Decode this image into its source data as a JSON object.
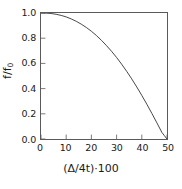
{
  "chart_data": {
    "type": "line",
    "title": "",
    "xlabel": "(Δ/4t)·100",
    "ylabel_main": "f/f",
    "ylabel_sub": "0",
    "xlim": [
      0,
      50
    ],
    "ylim": [
      0.0,
      1.0
    ],
    "xticks": [
      0,
      10,
      20,
      30,
      40,
      50
    ],
    "xtick_labels": [
      "0",
      "10",
      "20",
      "30",
      "40",
      "50"
    ],
    "yticks": [
      0.0,
      0.2,
      0.4,
      0.6,
      0.8,
      1.0
    ],
    "ytick_labels": [
      "0.0",
      "0.2",
      "0.4",
      "0.6",
      "0.8",
      "1.0"
    ],
    "grid": false,
    "legend": null,
    "series": [
      {
        "name": "f/f0",
        "color": "#333333",
        "x": [
          0,
          2,
          4,
          6,
          8,
          10,
          12,
          14,
          16,
          18,
          20,
          22,
          24,
          26,
          28,
          30,
          32,
          34,
          36,
          38,
          40,
          42,
          44,
          46,
          48,
          49,
          50
        ],
        "y": [
          1.0,
          0.999,
          0.996,
          0.99,
          0.981,
          0.969,
          0.953,
          0.934,
          0.911,
          0.885,
          0.855,
          0.821,
          0.783,
          0.741,
          0.696,
          0.647,
          0.594,
          0.537,
          0.477,
          0.413,
          0.346,
          0.276,
          0.203,
          0.128,
          0.051,
          0.026,
          0.0
        ]
      }
    ]
  },
  "axes": {
    "tick_color": "#5a5a5a",
    "frame_color": "#5a5a5a"
  }
}
